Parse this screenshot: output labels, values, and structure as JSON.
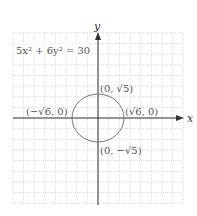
{
  "chart_data": {
    "type": "line",
    "title": "5x² + 6y² = 30",
    "equation": "5x² + 6y² = 30",
    "xlabel": "x",
    "ylabel": "y",
    "grid": true,
    "xlim": [
      -8,
      8
    ],
    "ylim": [
      -8,
      8
    ],
    "series": [
      {
        "name": "ellipse",
        "shape": "ellipse",
        "center": [
          0,
          0
        ],
        "semi_axis_x": 2.449,
        "semi_axis_y": 2.236
      }
    ],
    "annotations": [
      {
        "text": "(0, √5)",
        "point": [
          0,
          2.236
        ]
      },
      {
        "text": "(√6, 0)",
        "point": [
          2.449,
          0
        ]
      },
      {
        "text": "(−√6, 0)",
        "point": [
          -2.449,
          0
        ]
      },
      {
        "text": "(0, −√5)",
        "point": [
          0,
          -2.236
        ]
      }
    ]
  },
  "labels": {
    "equation": "5x² + 6y² = 30",
    "x_axis": "x",
    "y_axis": "y",
    "top": "(0, √5)",
    "right": "(√6, 0)",
    "left": "(−√6, 0)",
    "bottom": "(0, −√5)"
  },
  "colors": {
    "grid": "#c8c8c8",
    "axis": "#333333",
    "curve": "#777777",
    "text": "#555555"
  }
}
